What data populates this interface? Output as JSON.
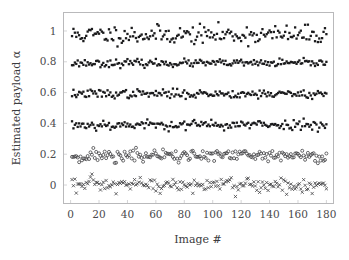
{
  "chart_data": {
    "type": "scatter",
    "title": "",
    "xlabel": "Image #",
    "ylabel": "Estimated payload α",
    "xlim": [
      -5,
      185
    ],
    "ylim": [
      -0.12,
      1.12
    ],
    "grid": false,
    "legend": null,
    "xticks": [
      0,
      20,
      40,
      60,
      80,
      100,
      120,
      140,
      160,
      180
    ],
    "xticklabels": [
      "0",
      "20",
      "40",
      "60",
      "80",
      "100",
      "120",
      "140",
      "160",
      "180"
    ],
    "yticks": [
      0,
      0.2,
      0.4,
      0.6,
      0.8,
      1
    ],
    "yticklabels": [
      "0",
      "0.2",
      "0.4",
      "0.6",
      "0.8",
      "1"
    ],
    "n_points_per_series": 180,
    "series": [
      {
        "name": "alpha = 1.0",
        "marker": "filled-square",
        "nominal": 1.0,
        "mean": 0.975,
        "spread": 0.03,
        "seed": 11,
        "values": []
      },
      {
        "name": "alpha = 0.8",
        "marker": "filled-square",
        "nominal": 0.8,
        "mean": 0.791,
        "spread": 0.012,
        "seed": 23,
        "values": []
      },
      {
        "name": "alpha = 0.6",
        "marker": "filled-square",
        "nominal": 0.6,
        "mean": 0.592,
        "spread": 0.014,
        "seed": 37,
        "values": []
      },
      {
        "name": "alpha = 0.4",
        "marker": "filled-square",
        "nominal": 0.4,
        "mean": 0.391,
        "spread": 0.016,
        "seed": 53,
        "values": []
      },
      {
        "name": "alpha = 0.2",
        "marker": "open-circle",
        "nominal": 0.2,
        "mean": 0.19,
        "spread": 0.022,
        "seed": 71,
        "values": []
      },
      {
        "name": "alpha = 0.0",
        "marker": "cross",
        "nominal": 0.0,
        "mean": -0.002,
        "spread": 0.026,
        "seed": 97,
        "values": []
      }
    ]
  }
}
